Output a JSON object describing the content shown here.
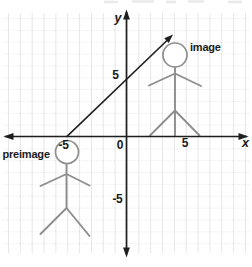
{
  "colors": {
    "axis": "#1f1f1f",
    "figure": "#8e8e8e",
    "grid": "#c9c9c9",
    "text": "#1a1a1a",
    "background": "#ffffff"
  },
  "axes": {
    "x_label": "x",
    "y_label": "y",
    "origin": "0",
    "x_neg": "-5",
    "x_pos": "5",
    "y_pos": "5",
    "y_neg": "-5"
  },
  "labels": {
    "preimage": "preimage",
    "image": "image"
  },
  "diagram": {
    "type": "translation-on-coordinate-plane",
    "grid_unit_px": 11.85,
    "origin_px": [
      126.5,
      136.5
    ],
    "preimage_head_center_units": [
      -5,
      -1.3
    ],
    "image_head_center_units": [
      4.1,
      6.9
    ],
    "translation_arrow_units": {
      "from": [
        -5,
        0
      ],
      "to": [
        3.9,
        8.6
      ]
    }
  }
}
